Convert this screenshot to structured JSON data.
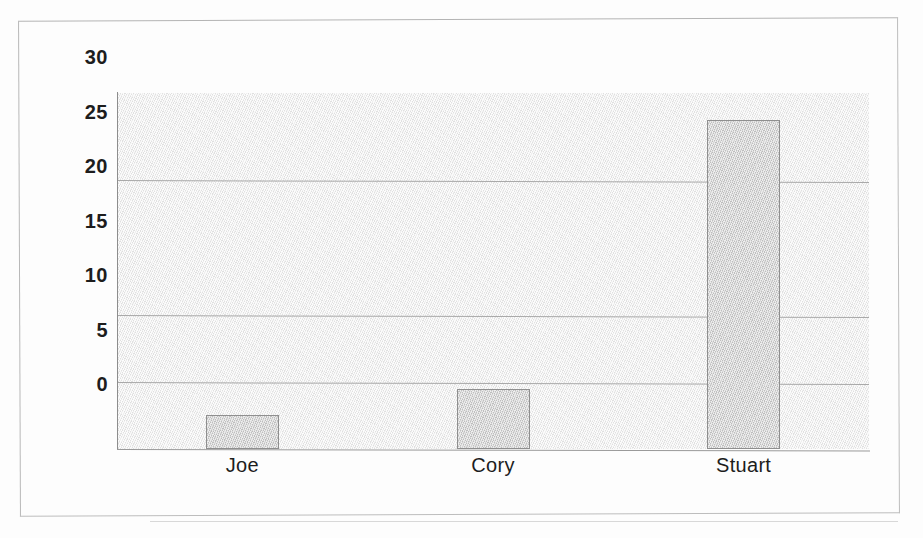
{
  "chart_data": {
    "type": "bar",
    "title": "",
    "subtitle": "",
    "xlabel": "",
    "ylabel": "",
    "categories": [
      "Joe",
      "Cory",
      "Stuart"
    ],
    "values": [
      2.5,
      4.5,
      24.5
    ],
    "series": [
      {
        "name": "",
        "values": [
          2.5,
          4.5,
          24.5
        ]
      }
    ],
    "yticks": [
      "30",
      "25",
      "20",
      "15",
      "10",
      "5",
      "0"
    ],
    "ytick_values": [
      30,
      25,
      20,
      15,
      10,
      5,
      0
    ],
    "ylim": [
      0,
      26.5
    ],
    "grid": "horizontal",
    "gridline_values": [
      20,
      10,
      5
    ],
    "legend": [],
    "legend_position": "none",
    "annotations": [],
    "colors": {
      "bar_fill": "#cfcfcf",
      "bar_border": "#8f8f8f",
      "plot_background": "#eeeeee",
      "gridline": "#a9a9a9",
      "axis": "#8d8d8d",
      "text": "#1d1d1d",
      "page_background": "#fdfdfd",
      "frame_border": "#bdbdbd"
    }
  },
  "figure": {
    "frame_label": "chart-border",
    "page_label": "scanned-page"
  }
}
